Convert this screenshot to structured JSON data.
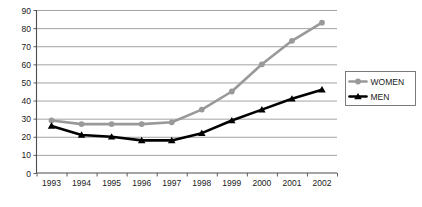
{
  "chart_data": {
    "type": "line",
    "title": "",
    "subtitle": "",
    "xlabel": "",
    "ylabel": "",
    "categories": [
      "1993",
      "1994",
      "1995",
      "1996",
      "1997",
      "1998",
      "1999",
      "2000",
      "2001",
      "2002"
    ],
    "series": [
      {
        "name": "WOMEN",
        "color": "#999999",
        "marker": "circle",
        "values": [
          29,
          27,
          27,
          27,
          28,
          35,
          45,
          60,
          73,
          83
        ]
      },
      {
        "name": "MEN",
        "color": "#000000",
        "marker": "triangle",
        "values": [
          26,
          21,
          20,
          18,
          18,
          22,
          29,
          35,
          41,
          46
        ]
      }
    ],
    "ylim": [
      0,
      90
    ],
    "ytick_step": 10,
    "yticks": [
      "0",
      "10",
      "20",
      "30",
      "40",
      "50",
      "60",
      "70",
      "80",
      "90"
    ],
    "grid": true,
    "grid_axis": "y",
    "legend_position": "right",
    "legend_entries": [
      "WOMEN",
      "MEN"
    ]
  },
  "axes": {
    "x_tick_labels": [
      "1993",
      "1994",
      "1995",
      "1996",
      "1997",
      "1998",
      "1999",
      "2000",
      "2001",
      "2002"
    ],
    "y_tick_labels": [
      "90",
      "80",
      "70",
      "60",
      "50",
      "40",
      "30",
      "20",
      "10",
      "0"
    ]
  },
  "legend": {
    "items": [
      {
        "label": "WOMEN",
        "color": "#999999"
      },
      {
        "label": "MEN",
        "color": "#000000"
      }
    ]
  },
  "colors": {
    "women": "#999999",
    "men": "#000000",
    "grid": "#8c8c8c",
    "axis": "#4d4d4d",
    "background": "#ffffff"
  }
}
